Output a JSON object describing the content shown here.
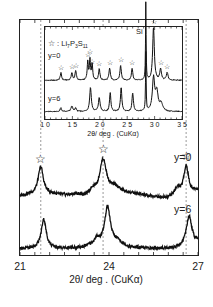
{
  "chart_data": [
    {
      "type": "line",
      "title": "",
      "xlabel": "2θ/ deg . (CuKα)",
      "ylabel": "",
      "xlim": [
        10,
        35
      ],
      "xticks": [
        "1 0",
        "1 5",
        "2 0",
        "2 5",
        "3 0",
        "3 5"
      ],
      "xtick_values": [
        10,
        15,
        20,
        25,
        30,
        35
      ],
      "legend": "☆ : Li7P3S11",
      "annotations": [
        {
          "text": "Si",
          "x": 28.4
        },
        {
          "text": "☆",
          "x": 12.9,
          "series": "y=0"
        },
        {
          "text": "☆",
          "x": 14.9,
          "series": "y=0"
        },
        {
          "text": "☆",
          "x": 15.6,
          "series": "y=0"
        },
        {
          "text": "☆",
          "x": 17.8,
          "series": "y=0"
        },
        {
          "text": "☆",
          "x": 18.2,
          "series": "y=0"
        },
        {
          "text": "☆",
          "x": 18.5,
          "series": "y=0"
        },
        {
          "text": "☆",
          "x": 19.9,
          "series": "y=0"
        },
        {
          "text": "☆",
          "x": 21.8,
          "series": "y=0"
        },
        {
          "text": "☆",
          "x": 23.8,
          "series": "y=0"
        },
        {
          "text": "☆",
          "x": 25.9,
          "series": "y=0"
        },
        {
          "text": "☆",
          "x": 29.8,
          "series": "y=0"
        },
        {
          "text": "☆",
          "x": 31.1,
          "series": "y=0"
        },
        {
          "text": "☆",
          "x": 32.3,
          "series": "y=0"
        }
      ],
      "series": [
        {
          "name": "y=0",
          "baseline": 0.42,
          "peaks": [
            {
              "x": 12.9,
              "h": 0.08,
              "w": 0.15
            },
            {
              "x": 14.9,
              "h": 0.08,
              "w": 0.15
            },
            {
              "x": 15.6,
              "h": 0.1,
              "w": 0.15
            },
            {
              "x": 17.8,
              "h": 0.2,
              "w": 0.12
            },
            {
              "x": 18.2,
              "h": 0.22,
              "w": 0.12
            },
            {
              "x": 18.6,
              "h": 0.18,
              "w": 0.12
            },
            {
              "x": 19.9,
              "h": 0.12,
              "w": 0.15
            },
            {
              "x": 21.8,
              "h": 0.13,
              "w": 0.15
            },
            {
              "x": 23.8,
              "h": 0.16,
              "w": 0.15
            },
            {
              "x": 25.9,
              "h": 0.13,
              "w": 0.15
            },
            {
              "x": 28.4,
              "h": 0.85,
              "w": 0.06
            },
            {
              "x": 29.8,
              "h": 0.58,
              "w": 0.18
            },
            {
              "x": 31.1,
              "h": 0.12,
              "w": 0.18
            },
            {
              "x": 32.3,
              "h": 0.08,
              "w": 0.18
            }
          ]
        },
        {
          "name": "y=6",
          "baseline": 0.08,
          "peaks": [
            {
              "x": 12.9,
              "h": 0.04,
              "w": 0.15
            },
            {
              "x": 14.9,
              "h": 0.06,
              "w": 0.18
            },
            {
              "x": 15.6,
              "h": 0.04,
              "w": 0.15
            },
            {
              "x": 18.3,
              "h": 0.26,
              "w": 0.18
            },
            {
              "x": 19.9,
              "h": 0.15,
              "w": 0.18
            },
            {
              "x": 21.9,
              "h": 0.2,
              "w": 0.15
            },
            {
              "x": 23.9,
              "h": 0.26,
              "w": 0.15
            },
            {
              "x": 26.0,
              "h": 0.2,
              "w": 0.15
            },
            {
              "x": 28.4,
              "h": 0.65,
              "w": 0.06
            },
            {
              "x": 29.8,
              "h": 0.35,
              "w": 0.25
            },
            {
              "x": 30.4,
              "h": 0.2,
              "w": 0.3
            },
            {
              "x": 31.2,
              "h": 0.08,
              "w": 0.3
            }
          ]
        }
      ]
    },
    {
      "type": "line",
      "title": "",
      "xlabel": "2θ/ deg . (CuKα)",
      "ylabel": "",
      "xlim": [
        21,
        27
      ],
      "xticks": [
        "21",
        "24",
        "27"
      ],
      "xtick_values": [
        21,
        24,
        27
      ],
      "reference_lines": [
        21.7,
        23.8,
        26.6
      ],
      "annotations": [
        {
          "text": "☆",
          "x": 21.7
        },
        {
          "text": "☆",
          "x": 23.8
        },
        {
          "text": "☆",
          "x": 26.6
        }
      ],
      "series": [
        {
          "name": "y=0",
          "baseline": 0.56,
          "peaks": [
            {
              "x": 21.7,
              "h": 0.26,
              "w": 0.1
            },
            {
              "x": 22.9,
              "h": 0.03,
              "w": 0.3
            },
            {
              "x": 23.45,
              "h": 0.06,
              "w": 0.12
            },
            {
              "x": 23.8,
              "h": 0.34,
              "w": 0.14
            },
            {
              "x": 24.2,
              "h": 0.06,
              "w": 0.2
            },
            {
              "x": 26.3,
              "h": 0.08,
              "w": 0.12
            },
            {
              "x": 26.6,
              "h": 0.28,
              "w": 0.1
            },
            {
              "x": 27.0,
              "h": 0.04,
              "w": 0.2
            }
          ]
        },
        {
          "name": "y=6",
          "baseline": 0.06,
          "peaks": [
            {
              "x": 21.8,
              "h": 0.28,
              "w": 0.1
            },
            {
              "x": 23.6,
              "h": 0.05,
              "w": 0.1
            },
            {
              "x": 23.95,
              "h": 0.38,
              "w": 0.12
            },
            {
              "x": 24.3,
              "h": 0.06,
              "w": 0.2
            },
            {
              "x": 26.7,
              "h": 0.3,
              "w": 0.12
            },
            {
              "x": 27.0,
              "h": 0.05,
              "w": 0.15
            }
          ]
        }
      ]
    }
  ],
  "inset": {
    "legend_star": "☆",
    "legend_label": " : Li",
    "legend_sub1": "7",
    "legend_p": "P",
    "legend_sub2": "3",
    "legend_s": "S",
    "legend_sub3": "11",
    "label_y0": "y=0",
    "label_y6": "y=6",
    "si_label": "Si",
    "xlabel": "2θ/ deg . (CuKα)"
  },
  "main": {
    "label_y0": "y=0",
    "label_y6": "y=6",
    "xlabel": "2θ/ deg . (CuKα)"
  }
}
